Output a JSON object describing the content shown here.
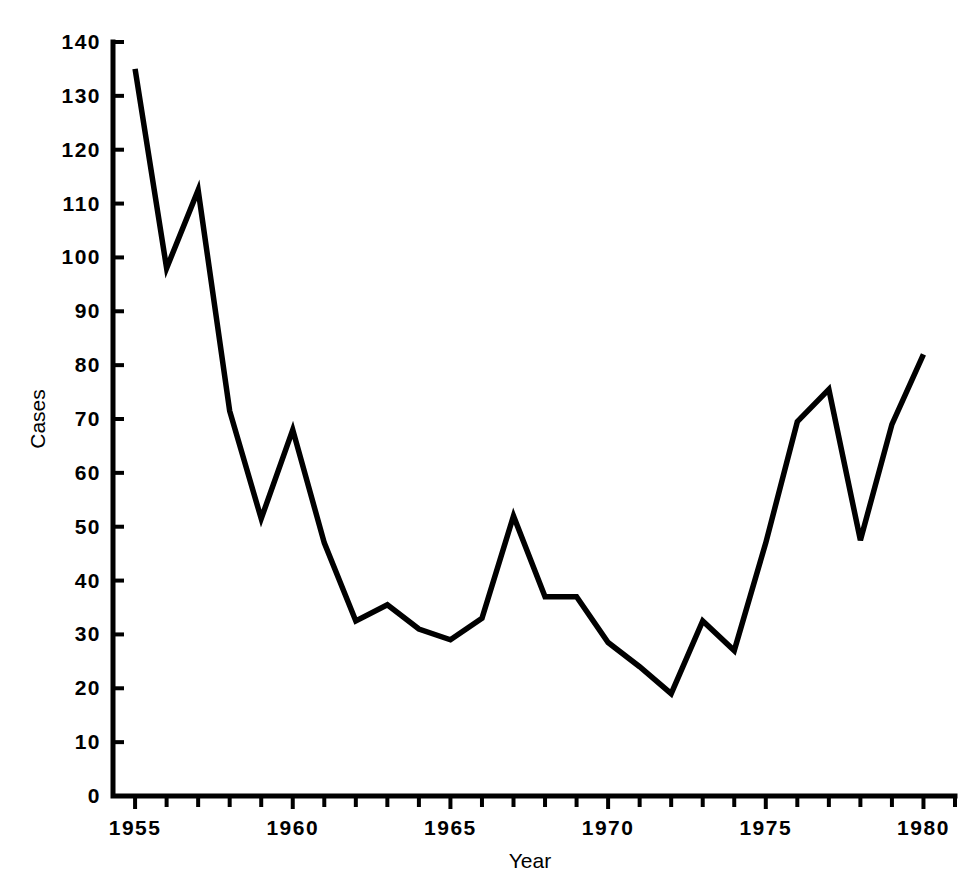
{
  "figure": {
    "background_color": "#ffffff",
    "line_color": "#000000",
    "axis_color": "#000000",
    "width": 977,
    "height": 889
  },
  "axes": {
    "x_title": "Year",
    "y_title": "Cases",
    "x_tick_labels": [
      "1955",
      "1960",
      "1965",
      "1970",
      "1975",
      "1980"
    ],
    "x_tick_years": [
      1955,
      1960,
      1965,
      1970,
      1975,
      1980
    ],
    "x_minor_years": [
      1956,
      1957,
      1958,
      1959,
      1961,
      1962,
      1963,
      1964,
      1966,
      1967,
      1968,
      1969,
      1971,
      1972,
      1973,
      1974,
      1976,
      1977,
      1978,
      1979,
      1981
    ],
    "y_tick_labels": [
      "0",
      "10",
      "20",
      "30",
      "40",
      "50",
      "60",
      "70",
      "80",
      "90",
      "100",
      "110",
      "120",
      "130",
      "140"
    ],
    "y_tick_values": [
      0,
      10,
      20,
      30,
      40,
      50,
      60,
      70,
      80,
      90,
      100,
      110,
      120,
      130,
      140
    ],
    "x_range": [
      1954.3,
      1981.0
    ],
    "y_range": [
      0,
      140
    ],
    "grid": "off",
    "spines": [
      "left",
      "bottom"
    ]
  },
  "chart_data": {
    "type": "line",
    "title": "",
    "subtitle": "",
    "xlabel": "Year",
    "ylabel": "Cases",
    "xlim": [
      1954.3,
      1981.0
    ],
    "ylim": [
      0,
      140
    ],
    "grid": false,
    "legend": "none",
    "x": [
      1955,
      1956,
      1957,
      1958,
      1959,
      1960,
      1961,
      1962,
      1963,
      1964,
      1965,
      1966,
      1967,
      1968,
      1969,
      1970,
      1971,
      1972,
      1973,
      1974,
      1975,
      1976,
      1977,
      1978,
      1979,
      1980
    ],
    "x_tick_labels": [
      "1955",
      "1960",
      "1965",
      "1970",
      "1975",
      "1980"
    ],
    "series": [
      {
        "name": "Cases",
        "color": "#000000",
        "values": [
          135,
          98,
          112.5,
          71.5,
          51.5,
          68,
          47,
          32.5,
          35.5,
          31,
          29,
          33,
          52,
          37,
          37,
          28.5,
          24,
          19,
          32.5,
          27,
          47,
          69.5,
          75.5,
          47.5,
          69,
          82
        ]
      }
    ]
  }
}
